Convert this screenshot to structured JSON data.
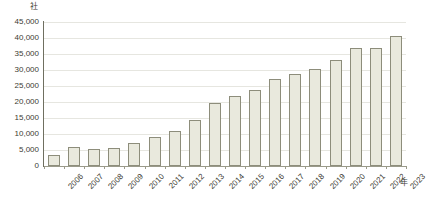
{
  "chart_data": {
    "type": "bar",
    "title": "",
    "subtitle": "",
    "xlabel": "年",
    "ylabel": "社",
    "categories": [
      "2006",
      "2007",
      "2008",
      "2009",
      "2010",
      "2011",
      "2012",
      "2013",
      "2014",
      "2015",
      "2016",
      "2017",
      "2018",
      "2019",
      "2020",
      "2021",
      "2022",
      "2023"
    ],
    "values": [
      3400,
      6000,
      5300,
      5600,
      7100,
      9000,
      10900,
      14500,
      19800,
      22000,
      23600,
      27100,
      28800,
      30300,
      33000,
      36800,
      36800,
      40500
    ],
    "series": [
      {
        "name": "",
        "values": [
          3400,
          6000,
          5300,
          5600,
          7100,
          9000,
          10900,
          14500,
          19800,
          22000,
          23600,
          27100,
          28800,
          30300,
          33000,
          36800,
          36800,
          40500
        ]
      }
    ],
    "ylim": [
      0,
      45000
    ],
    "ytick_values": [
      0,
      5000,
      10000,
      15000,
      20000,
      25000,
      30000,
      35000,
      40000,
      45000
    ],
    "ytick_labels": [
      "0",
      "5,000",
      "10,000",
      "15,000",
      "20,000",
      "25,000",
      "30,000",
      "35,000",
      "40,000",
      "45,000"
    ],
    "grid": true,
    "grid_axis": "y",
    "legend": false,
    "legend_position": "none",
    "bar_fill_color": "#e9e9dd",
    "bar_border_color": "#8d8d7b",
    "gridline_color": "#e6e6e0",
    "axis_color": "#6f6f60",
    "text_color": "#3d3d33",
    "background_color": "#ffffff",
    "xtick_rotation": -45
  }
}
